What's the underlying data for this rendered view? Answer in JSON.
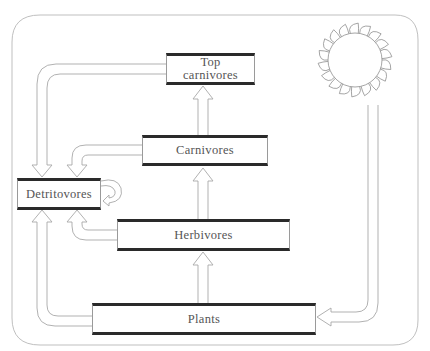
{
  "diagram": {
    "nodes": {
      "top_carnivores": {
        "line1": "Top",
        "line2": "carnivores"
      },
      "carnivores": {
        "label": "Carnivores"
      },
      "detritovores": {
        "label": "Detritovores"
      },
      "herbivores": {
        "label": "Herbivores"
      },
      "plants": {
        "label": "Plants"
      },
      "sun": {
        "label": "Sun"
      }
    },
    "edges": [
      {
        "from": "sun",
        "to": "plants"
      },
      {
        "from": "plants",
        "to": "herbivores"
      },
      {
        "from": "herbivores",
        "to": "carnivores"
      },
      {
        "from": "carnivores",
        "to": "top_carnivores"
      },
      {
        "from": "top_carnivores",
        "to": "detritovores"
      },
      {
        "from": "carnivores",
        "to": "detritovores"
      },
      {
        "from": "herbivores",
        "to": "detritovores"
      },
      {
        "from": "plants",
        "to": "detritovores"
      },
      {
        "from": "detritovores",
        "to": "detritovores"
      }
    ],
    "colors": {
      "line": "#9a9a9a",
      "box_border": "#2a2a2a",
      "text": "#555555",
      "background": "#ffffff"
    }
  }
}
